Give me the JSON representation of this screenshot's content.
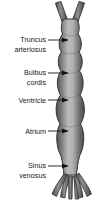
{
  "figure": {
    "background_color": "#ffffff",
    "tube": {
      "fill_light": "#c9c9c9",
      "fill_mid": "#8c8c8c",
      "fill_dark": "#4a4a4a",
      "outline_color": "#3a3a3a",
      "segment_count": 5
    },
    "leader": {
      "line_color": "#1a1a1a",
      "arrow_color": "#111111"
    },
    "labels": [
      {
        "id": "truncus-arteriosus",
        "lines": [
          "Truncus",
          "arteriosus"
        ],
        "line1": "Truncus",
        "line2": "arteriosus",
        "text_x": 46,
        "text_y1": 39,
        "text_y2": 49,
        "leader_y": 40,
        "leader_x1": 48,
        "leader_x2": 68
      },
      {
        "id": "bulbus-cordis",
        "lines": [
          "Bulbus",
          "cordis"
        ],
        "line1": "Bulbus",
        "line2": "cordis",
        "text_x": 46,
        "text_y1": 72,
        "text_y2": 82,
        "leader_y": 73,
        "leader_x1": 48,
        "leader_x2": 68
      },
      {
        "id": "ventricle",
        "lines": [
          "Ventricle"
        ],
        "line1": "Ventricle",
        "line2": "",
        "text_x": 46,
        "text_y1": 102,
        "text_y2": 102,
        "leader_y": 100,
        "leader_x1": 48,
        "leader_x2": 68
      },
      {
        "id": "atrium",
        "lines": [
          "Atrium"
        ],
        "line1": "Atrium",
        "line2": "",
        "text_x": 46,
        "text_y1": 133,
        "text_y2": 133,
        "leader_y": 131,
        "leader_x1": 48,
        "leader_x2": 68
      },
      {
        "id": "sinus-venosus",
        "lines": [
          "Sinus",
          "venosus"
        ],
        "line1": "Sinus",
        "line2": "venosus",
        "text_x": 46,
        "text_y1": 165,
        "text_y2": 175,
        "leader_y": 166,
        "leader_x1": 48,
        "leader_x2": 68
      }
    ]
  }
}
